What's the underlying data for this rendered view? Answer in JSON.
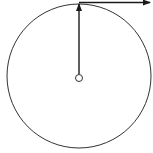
{
  "diagram": {
    "type": "circular-motion",
    "background": "#ffffff",
    "stroke_color": "#1a1a1a",
    "circle": {
      "cx": 79,
      "cy": 76,
      "r": 72
    },
    "center_point": {
      "cx": 79,
      "cy": 78,
      "r": 3.5
    },
    "radius_vector": {
      "x1": 79,
      "y1": 74,
      "x2": 79,
      "y2": 4,
      "direction": "up"
    },
    "tangent_vector": {
      "x1": 79,
      "y1": 2.5,
      "x2": 150,
      "y2": 2.5,
      "direction": "right"
    }
  }
}
